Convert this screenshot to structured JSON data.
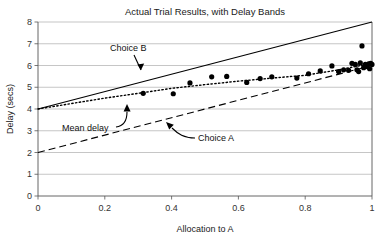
{
  "chart_data": {
    "type": "scatter",
    "title": "Actual Trial Results, with Delay Bands",
    "xlabel": "Allocation to A",
    "ylabel": "Delay (secs)",
    "xlim": [
      0,
      1
    ],
    "ylim": [
      0,
      8
    ],
    "grid": true,
    "grid_axis": "y",
    "legend": "none (inline annotations)",
    "xticks": [
      "0",
      "0.2",
      "0.4",
      "0.6",
      "0.8",
      "1"
    ],
    "xtick_values": [
      0,
      0.2,
      0.4,
      0.6,
      0.8,
      1
    ],
    "yticks": [
      "0",
      "1",
      "2",
      "3",
      "4",
      "5",
      "6",
      "7",
      "8"
    ],
    "ytick_values": [
      0,
      1,
      2,
      3,
      4,
      5,
      6,
      7,
      8
    ],
    "series": [
      {
        "name": "Choice B",
        "style": "solid-line",
        "description": "Upper delay band, linear from (0,4) to (1,8)",
        "x": [
          0,
          1
        ],
        "values": [
          4,
          8
        ]
      },
      {
        "name": "Choice A",
        "style": "dashed-line",
        "description": "Lower delay band, linear from (0,2) to (1,6)",
        "x": [
          0,
          1
        ],
        "values": [
          2,
          6
        ]
      },
      {
        "name": "Mean delay",
        "style": "dotted-line",
        "description": "Mean delay trend rising from 4 at x=0 to about 6.1 at x=1",
        "x": [
          0,
          0.1,
          0.2,
          0.3,
          0.4,
          0.5,
          0.6,
          0.7,
          0.8,
          0.9,
          0.95,
          1
        ],
        "values": [
          4.0,
          4.25,
          4.5,
          4.72,
          4.95,
          5.12,
          5.28,
          5.42,
          5.55,
          5.8,
          5.95,
          6.1
        ]
      },
      {
        "name": "Trial results",
        "style": "scatter-markers",
        "description": "Observed per-trial delays, black filled circles",
        "points": [
          [
            0.315,
            4.72
          ],
          [
            0.405,
            4.7
          ],
          [
            0.455,
            5.2
          ],
          [
            0.52,
            5.48
          ],
          [
            0.565,
            5.5
          ],
          [
            0.625,
            5.22
          ],
          [
            0.665,
            5.4
          ],
          [
            0.7,
            5.48
          ],
          [
            0.775,
            5.42
          ],
          [
            0.81,
            5.62
          ],
          [
            0.845,
            5.75
          ],
          [
            0.88,
            5.98
          ],
          [
            0.9,
            5.72
          ],
          [
            0.915,
            5.8
          ],
          [
            0.93,
            5.78
          ],
          [
            0.94,
            6.1
          ],
          [
            0.95,
            6.05
          ],
          [
            0.955,
            5.8
          ],
          [
            0.96,
            5.72
          ],
          [
            0.965,
            6.12
          ],
          [
            0.97,
            6.9
          ],
          [
            0.975,
            5.9
          ],
          [
            0.98,
            6.05
          ],
          [
            0.985,
            5.95
          ],
          [
            0.99,
            6.08
          ],
          [
            0.993,
            5.85
          ],
          [
            0.996,
            6.1
          ],
          [
            1.0,
            6.05
          ]
        ]
      }
    ],
    "annotations": [
      {
        "label": "Choice B",
        "points_to": "solid upper band line",
        "arrow": "straight arrow angled down-right"
      },
      {
        "label": "Mean delay",
        "points_to": "dotted mean line",
        "arrow": "curved arrow angled up-right"
      },
      {
        "label": "Choice A",
        "points_to": "dashed lower band line",
        "arrow": "curved arrow angled up-left"
      }
    ]
  },
  "colors": {
    "background": "#ffffff",
    "ink": "#000000",
    "gridline": "#aeaeae",
    "axis": "#555555"
  }
}
